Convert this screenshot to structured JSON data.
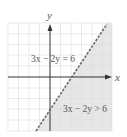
{
  "graph": {
    "axis_labels": {
      "x": "x",
      "y": "y"
    },
    "boundary_label": "3x − 2y = 6",
    "region_label": "3x − 2y > 6",
    "boundary_style": "dashed",
    "colors": {
      "grid": "#dcdcdc",
      "axis": "#333333",
      "shading": "#e6e6e6",
      "boundary": "#666666",
      "text": "#555555"
    },
    "x_range": [
      -4,
      6
    ],
    "y_range": [
      -5,
      5
    ],
    "x_intercept": 2,
    "y_intercept": -3
  }
}
